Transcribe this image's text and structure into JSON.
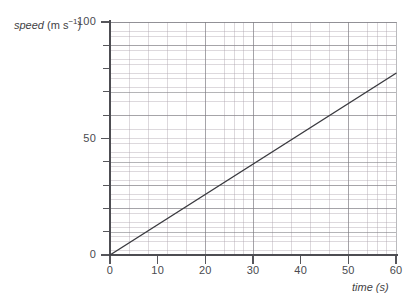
{
  "chart_data": {
    "type": "line",
    "title": "",
    "xlabel": "time (s)",
    "ylabel_text": "speed",
    "ylabel_unit_prefix": "(m s",
    "ylabel_unit_exponent": "−1",
    "ylabel_unit_suffix": ")",
    "xlim": [
      0,
      60
    ],
    "ylim": [
      0,
      100
    ],
    "x_major_step": 10,
    "y_major_step": 10,
    "x_minor_step": 2,
    "y_minor_step": 2,
    "grid": true,
    "grid_style": "graph-paper",
    "legend": "none",
    "x_tick_labels": [
      "0",
      "10",
      "20",
      "30",
      "40",
      "50",
      "60"
    ],
    "x_tick_values": [
      0,
      10,
      20,
      30,
      40,
      50,
      60
    ],
    "y_tick_values": [
      0,
      10,
      20,
      30,
      40,
      50,
      60,
      70,
      80,
      90,
      100
    ],
    "y_labeled_ticks": [
      {
        "value": 0,
        "label": "0"
      },
      {
        "value": 50,
        "label": "50"
      },
      {
        "value": 100,
        "label": "100"
      }
    ],
    "series": [
      {
        "name": "speed-time line",
        "color": "#3a3a3f",
        "x": [
          0,
          60
        ],
        "values": [
          0,
          78
        ],
        "description": "straight line of constant gradient through the origin"
      }
    ],
    "gradient": 1.3,
    "gradient_units": "m s−2"
  },
  "figure": {
    "background_color": "#ffffff",
    "axis_color": "#4d4d52",
    "grid_major_color": "#787a7d",
    "grid_minor_color": "#aaa0aa",
    "line_color": "#3a3a3f"
  }
}
